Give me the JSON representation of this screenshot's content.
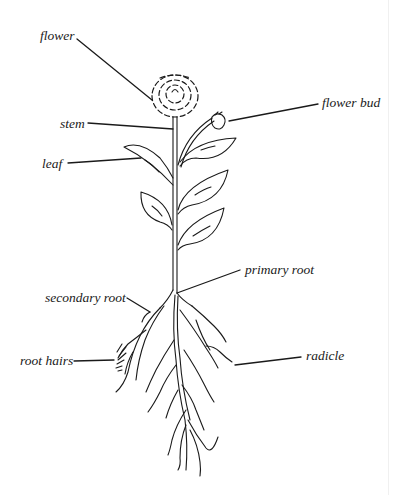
{
  "diagram": {
    "labels": {
      "flower": "flower",
      "flower_bud": "flower bud",
      "stem": "stem",
      "leaf": "leaf",
      "primary_root": "primary root",
      "secondary_root": "secondary root",
      "root_hairs": "root hairs",
      "radicle": "radicle"
    },
    "colors": {
      "ink": "#1a1a1a",
      "background": "#ffffff"
    }
  }
}
